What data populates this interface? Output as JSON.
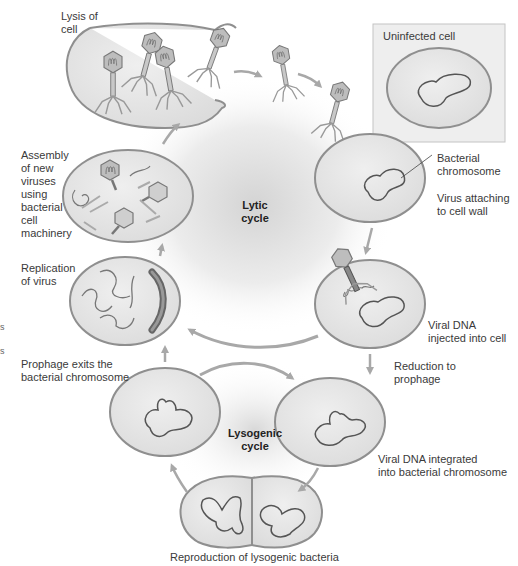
{
  "figure": {
    "colors": {
      "cell_fill": "#e4e4e4",
      "cell_stroke": "#8f8f8f",
      "chromosome_stroke": "#555555",
      "arrow": "#a8a8a8",
      "virus_fill": "#b8b8b8",
      "background": "#ffffff",
      "inset_fill": "#eeeeee"
    }
  },
  "cycles": {
    "lytic": "Lytic\ncycle",
    "lysogenic": "Lysogenic\ncycle"
  },
  "labels": {
    "lysis": "Lysis of\ncell",
    "uninfected": "Uninfected cell",
    "bacterial_chromosome": "Bacterial\nchromosome",
    "virus_attaching": "Virus attaching\nto cell wall",
    "viral_dna_injected": "Viral DNA\ninjected into cell",
    "reduction": "Reduction to\nprophage",
    "integrated": "Viral DNA integrated\ninto bacterial chromosome",
    "reproduction": "Reproduction of lysogenic bacteria",
    "prophage_exits": "Prophage exits the\nbacterial chromosome",
    "replication": "Replication\nof virus",
    "assembly": "Assembly\nof new\nviruses\nusing\nbacterial\ncell\nmachinery"
  },
  "edge_fragments": [
    "s",
    "s"
  ]
}
